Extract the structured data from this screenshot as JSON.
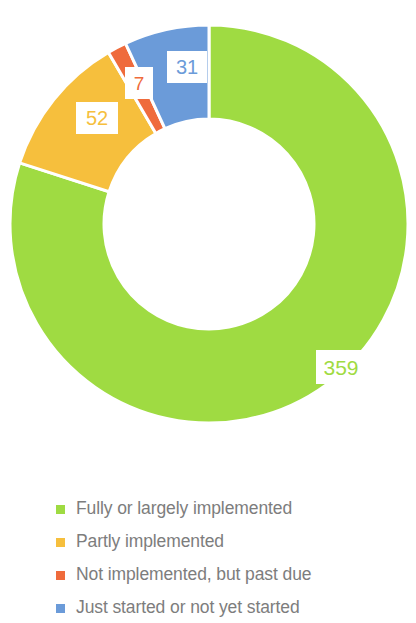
{
  "chart_data": {
    "type": "pie",
    "variant": "donut",
    "title": "",
    "subtitle": "",
    "xlabel": "",
    "ylabel": "",
    "total": 449,
    "grid": false,
    "legend_position": "bottom",
    "start_angle_deg": 0,
    "direction": "clockwise",
    "inner_radius_ratio": 0.5,
    "categories": [
      "Fully or largely implemented",
      "Partly implemented",
      "Not implemented, but past due",
      "Just started or not yet started"
    ],
    "values": [
      359,
      52,
      7,
      31
    ],
    "colors": [
      "#9fdb42",
      "#f6bf3d",
      "#ef6b3c",
      "#6b9bd9"
    ],
    "slices": [
      {
        "label": "Fully or largely implemented",
        "value": 359,
        "value_text": "359",
        "color": "#9fdb42",
        "start_deg": 0,
        "end_deg": 287.9
      },
      {
        "label": "Partly implemented",
        "value": 52,
        "value_text": "52",
        "color": "#f6bf3d",
        "start_deg": 287.9,
        "end_deg": 329.6
      },
      {
        "label": "Not implemented, but past due",
        "value": 7,
        "value_text": "7",
        "color": "#ef6b3c",
        "start_deg": 329.6,
        "end_deg": 335.2
      },
      {
        "label": "Just started or not yet started",
        "value": 31,
        "value_text": "31",
        "color": "#6b9bd9",
        "start_deg": 335.2,
        "end_deg": 360
      }
    ]
  },
  "labels": {
    "green": "359",
    "yellow": "52",
    "red": "7",
    "blue": "31"
  },
  "legend": {
    "items": [
      {
        "label": "Fully or largely implemented",
        "color": "#9fdb42"
      },
      {
        "label": "Partly implemented",
        "color": "#f6bf3d"
      },
      {
        "label": "Not implemented, but past due",
        "color": "#ef6b3c"
      },
      {
        "label": "Just started or not yet started",
        "color": "#6b9bd9"
      }
    ]
  }
}
